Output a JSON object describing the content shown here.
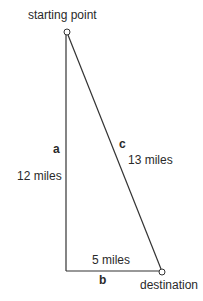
{
  "diagram": {
    "type": "right-triangle",
    "colors": {
      "line": "#333333",
      "text": "#2a2a2a",
      "background": "#ffffff"
    },
    "points": {
      "start": {
        "label": "starting point",
        "x": 67,
        "y": 32
      },
      "corner": {
        "x": 66,
        "y": 271
      },
      "destination": {
        "label": "destination",
        "x": 162,
        "y": 272
      }
    },
    "sides": {
      "a": {
        "letter": "a",
        "length": "12 miles"
      },
      "b": {
        "letter": "b",
        "length": "5 miles"
      },
      "c": {
        "letter": "c",
        "length": "13 miles"
      }
    }
  }
}
